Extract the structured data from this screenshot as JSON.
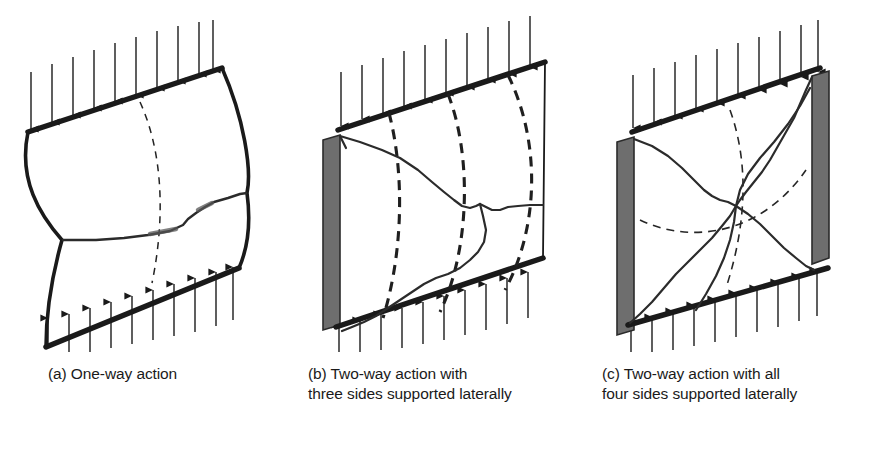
{
  "figure": {
    "background_color": "#ffffff",
    "line_color": "#1a1a1a",
    "support_fill_color": "#6e6e6e",
    "support_stroke_color": "#2b2b2b",
    "crack_color": "#333333",
    "arch_line_color": "#222222"
  },
  "panels": [
    {
      "id": "a",
      "caption_lines": [
        "(a) One-way action"
      ],
      "support_condition": "one-way",
      "supported_sides": [
        "top",
        "bottom"
      ],
      "lateral_supports": 0,
      "arch_lines": 1,
      "arch_line_style": "thin-dashed",
      "crack_pattern": "single horizontal crack at mid-height",
      "load_arrows_top": 10,
      "load_arrows_bottom": 10,
      "top_arrow_direction": "down",
      "bottom_arrow_direction": "up",
      "deformed_edges": "both vertical edges bulge outward"
    },
    {
      "id": "b",
      "caption_lines": [
        "(b) Two-way action with",
        "three sides supported laterally"
      ],
      "support_condition": "two-way",
      "supported_sides": [
        "top",
        "bottom",
        "left"
      ],
      "lateral_supports": 1,
      "arch_lines": 3,
      "arch_line_style": "bold-dashed",
      "crack_pattern": "diagonal cracks from supported corners meeting a horizontal crack",
      "load_arrows_top": 10,
      "load_arrows_bottom": 10,
      "top_arrow_direction": "down",
      "bottom_arrow_direction": "up",
      "free_edge": "right"
    },
    {
      "id": "c",
      "caption_lines": [
        "(c) Two-way action with all",
        "four sides supported laterally"
      ],
      "support_condition": "two-way",
      "supported_sides": [
        "top",
        "bottom",
        "left",
        "right"
      ],
      "lateral_supports": 2,
      "arch_lines": 2,
      "arch_line_style": "thin-dashed",
      "crack_pattern": "diagonal yield lines radiating from centre to all four corners",
      "load_arrows_top": 10,
      "load_arrows_bottom": 10,
      "top_arrow_direction": "down",
      "bottom_arrow_direction": "up",
      "free_edge": "none"
    }
  ]
}
